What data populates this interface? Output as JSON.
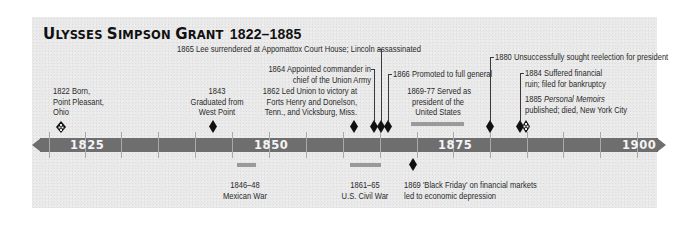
{
  "title": {
    "name_initial_1": "U",
    "name_rest_1": "LYSSES ",
    "name_initial_2": "S",
    "name_rest_2": "IMPSON ",
    "name_initial_3": "G",
    "name_rest_3": "RANT",
    "years": "1822–1885"
  },
  "axis": {
    "start_year": 1820,
    "end_year": 1903,
    "major_labels": [
      "1825",
      "1850",
      "1875",
      "1900"
    ],
    "tick_interval_years": 5,
    "color": "#6e6e6e"
  },
  "events_above": [
    {
      "id": "e1822",
      "lines": [
        "1822 Born,",
        "Point Pleasant,",
        "Ohio"
      ],
      "year": 1822,
      "marker": "hollow-diamond"
    },
    {
      "id": "e1843",
      "lines": [
        "1843",
        "Graduated from",
        "West Point"
      ],
      "year": 1843,
      "marker": "diamond"
    },
    {
      "id": "e1862",
      "lines": [
        "1862 Led Union to victory at",
        "Forts Henry and Donelson,",
        "Tenn., and Vicksburg, Miss."
      ],
      "year": 1862,
      "marker": "diamond"
    },
    {
      "id": "e1865",
      "lines": [
        "1865 Lee surrendered at Appomattox Court House; Lincoln assassinated"
      ],
      "year": 1865,
      "marker": "diamond"
    },
    {
      "id": "e1864",
      "lines": [
        "1864 Appointed commander in",
        "chief of the Union Army"
      ],
      "year": 1864,
      "marker": "diamond"
    },
    {
      "id": "e1866",
      "lines": [
        "1866 Promoted to full general"
      ],
      "year": 1866,
      "marker": "diamond"
    },
    {
      "id": "e1869",
      "lines": [
        "1869-77 Served as",
        "president of the",
        "United States"
      ],
      "year_start": 1869,
      "year_end": 1877,
      "marker": "span"
    },
    {
      "id": "e1880",
      "lines": [
        "1880 Unsuccessfully sought reelection for president"
      ],
      "year": 1880,
      "marker": "diamond"
    },
    {
      "id": "e1884",
      "lines": [
        "1884 Suffered financial",
        "ruin; filed for bankruptcy"
      ],
      "year": 1884,
      "marker": "diamond"
    },
    {
      "id": "e1885",
      "prefix": "1885 ",
      "italic": "Personal Memoirs",
      "lines": [
        "published; died, New York City"
      ],
      "year": 1885,
      "marker": "hollow-diamond"
    }
  ],
  "events_below": [
    {
      "id": "e1846",
      "lines": [
        "1846–48",
        "Mexican War"
      ],
      "year_start": 1846,
      "year_end": 1848,
      "marker": "span"
    },
    {
      "id": "e1861",
      "lines": [
        "1861–65",
        "U.S. Civil War"
      ],
      "year_start": 1861,
      "year_end": 1865,
      "marker": "span"
    },
    {
      "id": "e1869b",
      "lines": [
        "1869 'Black Friday' on financial markets",
        "led to economic depression"
      ],
      "year": 1869,
      "marker": "diamond"
    }
  ]
}
